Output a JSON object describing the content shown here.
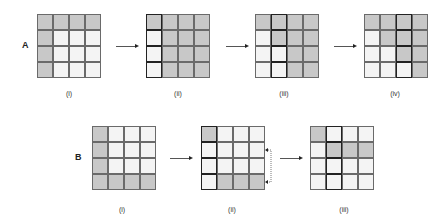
{
  "rows": [
    {
      "label": "A",
      "label_pos": [
        22,
        40
      ],
      "panels": [
        {
          "caption": "(i)",
          "x": 37,
          "y": 14,
          "cap_x": 69,
          "cap_y": 90,
          "cells": [
            [
              "g",
              "g",
              "g",
              "g"
            ],
            [
              "g",
              "w",
              "w",
              "w"
            ],
            [
              "g",
              "w",
              "w",
              "w"
            ],
            [
              "g",
              "w",
              "w",
              "w"
            ]
          ],
          "bold": []
        },
        {
          "caption": "(ii)",
          "x": 146,
          "y": 14,
          "cap_x": 178,
          "cap_y": 90,
          "cells": [
            [
              "g",
              "g",
              "g",
              "g"
            ],
            [
              "w",
              "g",
              "g",
              "g"
            ],
            [
              "w",
              "g",
              "g",
              "g"
            ],
            [
              "w",
              "g",
              "g",
              "g"
            ]
          ],
          "bold": [
            [
              0,
              0
            ],
            [
              1,
              0
            ],
            [
              2,
              0
            ],
            [
              3,
              0
            ]
          ]
        },
        {
          "caption": "(iii)",
          "x": 255,
          "y": 14,
          "cap_x": 284,
          "cap_y": 90,
          "cells": [
            [
              "g",
              "g",
              "g",
              "g"
            ],
            [
              "w",
              "g",
              "g",
              "g"
            ],
            [
              "w",
              "w",
              "g",
              "g"
            ],
            [
              "w",
              "w",
              "g",
              "g"
            ]
          ],
          "bold": [
            [
              0,
              1
            ],
            [
              1,
              1
            ],
            [
              2,
              1
            ],
            [
              3,
              1
            ]
          ]
        },
        {
          "caption": "(iv)",
          "x": 364,
          "y": 14,
          "cap_x": 395,
          "cap_y": 90,
          "cells": [
            [
              "g",
              "g",
              "g",
              "g"
            ],
            [
              "w",
              "g",
              "g",
              "g"
            ],
            [
              "w",
              "w",
              "g",
              "g"
            ],
            [
              "w",
              "w",
              "w",
              "g"
            ]
          ],
          "bold": [
            [
              0,
              2
            ],
            [
              1,
              2
            ],
            [
              2,
              2
            ],
            [
              3,
              2
            ]
          ]
        }
      ],
      "arrows": [
        [
          116,
          46,
          21
        ],
        [
          226,
          46,
          21
        ],
        [
          334,
          46,
          21
        ]
      ]
    },
    {
      "label": "B",
      "label_pos": [
        75,
        152
      ],
      "panels": [
        {
          "caption": "(i)",
          "x": 92,
          "y": 126,
          "cap_x": 122,
          "cap_y": 206,
          "cells": [
            [
              "g",
              "w",
              "w",
              "w"
            ],
            [
              "g",
              "w",
              "w",
              "w"
            ],
            [
              "g",
              "w",
              "w",
              "w"
            ],
            [
              "g",
              "g",
              "g",
              "g"
            ]
          ],
          "bold": []
        },
        {
          "caption": "(ii)",
          "x": 201,
          "y": 126,
          "cap_x": 232,
          "cap_y": 206,
          "cells": [
            [
              "g",
              "w",
              "w",
              "w"
            ],
            [
              "w",
              "w",
              "w",
              "w"
            ],
            [
              "w",
              "w",
              "w",
              "w"
            ],
            [
              "w",
              "g",
              "g",
              "g"
            ]
          ],
          "bold": [
            [
              0,
              0
            ],
            [
              1,
              0
            ],
            [
              2,
              0
            ],
            [
              3,
              0
            ]
          ]
        },
        {
          "caption": "(iii)",
          "x": 310,
          "y": 126,
          "cap_x": 344,
          "cap_y": 206,
          "cells": [
            [
              "g",
              "w",
              "w",
              "w"
            ],
            [
              "w",
              "g",
              "g",
              "g"
            ],
            [
              "w",
              "w",
              "w",
              "w"
            ],
            [
              "w",
              "w",
              "w",
              "w"
            ]
          ],
          "bold": [
            [
              0,
              1
            ],
            [
              1,
              1
            ],
            [
              2,
              1
            ],
            [
              3,
              1
            ]
          ]
        }
      ],
      "arrows": [
        [
          170,
          158,
          21
        ],
        [
          280,
          158,
          21
        ]
      ],
      "dotted_arrow": {
        "x": 266,
        "y1": 150,
        "y2": 182
      }
    }
  ]
}
